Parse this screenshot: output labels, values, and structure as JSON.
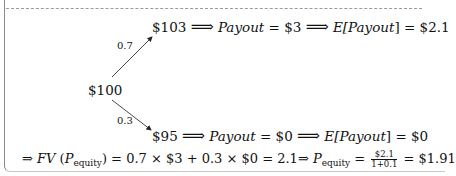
{
  "tree": {
    "root": "$100",
    "up": {
      "prob": "0.7",
      "price": "$103",
      "payout_label": "Payout",
      "payout_eq": " = $3",
      "expect_label_pre": "E[",
      "expect_label": "Payout",
      "expect_label_post": "] = $2.1"
    },
    "down": {
      "prob": "0.3",
      "price": "$95",
      "payout_label": "Payout",
      "payout_eq": " = $0",
      "expect_label_pre": "E[",
      "expect_label": "Payout",
      "expect_label_post": "] = $0"
    },
    "implies_arrow": "⟹"
  },
  "formula": {
    "lead_arrow": "⇒",
    "fv": "FV",
    "open": " (",
    "p": "P",
    "p_sub": "equity",
    "close": ")",
    "calc": " = 0.7 × $3 + 0.3 × $0 = 2.1⇒ ",
    "p2": "P",
    "p2_sub": "equity",
    "eq": " = ",
    "frac_num": "$2.1",
    "frac_den": "1+0.1",
    "result": " = $1.91"
  }
}
